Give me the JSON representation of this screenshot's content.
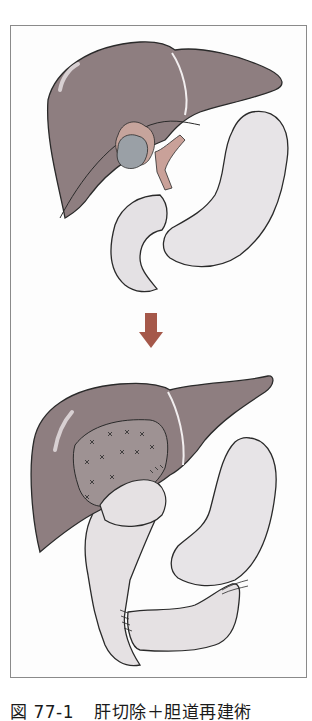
{
  "figure": {
    "number": "図 77-1",
    "title": "肝切除＋胆道再建術",
    "panels": [
      {
        "label": "before",
        "description": "Liver with tumor at hilum (bile duct), stomach, duodenum"
      },
      {
        "label": "after",
        "description": "Resected liver surface with sutures, hepaticojejunostomy, Roux-en-Y jejunal limb"
      }
    ],
    "arrow": {
      "direction": "down",
      "color": "#a5584a"
    },
    "colors": {
      "liver": "#8e7e80",
      "liver_outline": "#2a2a2a",
      "stomach": "#e6e3e6",
      "tumor": "#9aa0a6",
      "bile_duct": "#c9a199",
      "frame": "#8a8a8a"
    }
  }
}
